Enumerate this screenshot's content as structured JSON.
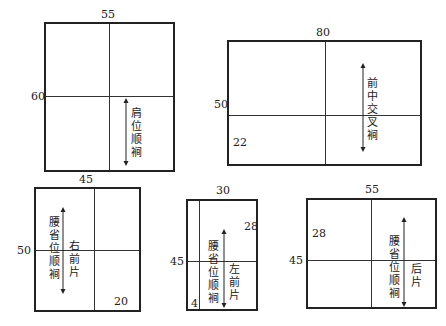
{
  "panels": [
    {
      "id": "shoulder",
      "width_label": "55",
      "height_label": "60",
      "arrow_text": "肩位顺裥"
    },
    {
      "id": "front-cross",
      "width_label": "80",
      "height_label": "50",
      "corner_label": "22",
      "arrow_text": "前中交叉裥"
    },
    {
      "id": "right-front",
      "width_label": "45",
      "height_label": "50",
      "corner_label": "20",
      "arrow_text": "腰省位顺裥",
      "piece_label": "右前片"
    },
    {
      "id": "left-front",
      "width_label": "30",
      "height_label": "45",
      "corner_label_top": "28",
      "corner_label_bottom": "4",
      "arrow_text": "腰省位顺裥",
      "piece_label": "左前片"
    },
    {
      "id": "back",
      "width_label": "55",
      "height_label": "45",
      "corner_label": "28",
      "arrow_text": "腰省位顺裥",
      "piece_label": "后片"
    }
  ]
}
